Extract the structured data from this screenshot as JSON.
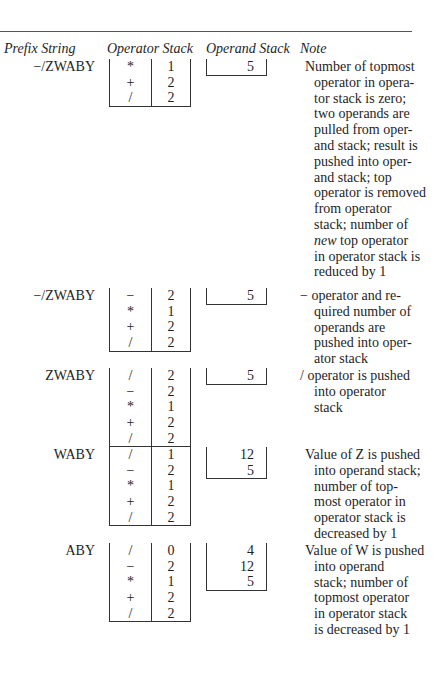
{
  "headers": {
    "prefix": "Prefix String",
    "operator_stack": "Operator Stack",
    "operand_stack": "Operand Stack",
    "note": "Note"
  },
  "steps": [
    {
      "prefix": "−/ZWABY",
      "operators": [
        [
          "*",
          "1"
        ],
        [
          "+",
          "2"
        ],
        [
          "/",
          "2"
        ]
      ],
      "operands": [
        "5"
      ],
      "note_lines": [
        "Number of topmost",
        "operator in opera-",
        "tor stack is zero;",
        "two operands are",
        "pulled from oper-",
        "and stack; result is",
        "pushed into oper-",
        "and stack; top",
        "operator is removed",
        "from operator",
        "stack; number of",
        "new top operator",
        "in operator stack is",
        "reduced by 1"
      ]
    },
    {
      "prefix": "−/ZWABY",
      "operators": [
        [
          "−",
          "2"
        ],
        [
          "*",
          "1"
        ],
        [
          "+",
          "2"
        ],
        [
          "/",
          "2"
        ]
      ],
      "operands": [
        "5"
      ],
      "note_lines": [
        "− operator and re-",
        "quired number of",
        "operands are",
        "pushed into oper-",
        "ator stack"
      ]
    },
    {
      "prefix": "ZWABY",
      "operators": [
        [
          "/",
          "2"
        ],
        [
          "−",
          "2"
        ],
        [
          "*",
          "1"
        ],
        [
          "+",
          "2"
        ],
        [
          "/",
          "2"
        ]
      ],
      "operands": [
        "5"
      ],
      "note_lines": [
        "/ operator is pushed",
        "into operator",
        "stack"
      ]
    },
    {
      "prefix": "WABY",
      "operators": [
        [
          "/",
          "1"
        ],
        [
          "−",
          "2"
        ],
        [
          "*",
          "1"
        ],
        [
          "+",
          "2"
        ],
        [
          "/",
          "2"
        ]
      ],
      "operands": [
        "12",
        "5"
      ],
      "note_lines": [
        "Value of Z is pushed",
        "into operand stack;",
        "number of top-",
        "most operator in",
        "operator stack is",
        "decreased by 1"
      ]
    },
    {
      "prefix": "ABY",
      "operators": [
        [
          "/",
          "0"
        ],
        [
          "−",
          "2"
        ],
        [
          "*",
          "1"
        ],
        [
          "+",
          "2"
        ],
        [
          "/",
          "2"
        ]
      ],
      "operands": [
        "4",
        "12",
        "5"
      ],
      "note_lines": [
        "Value of W is pushed",
        "into operand",
        "stack; number of",
        "topmost operator",
        "in operator stack",
        "is decreased by 1"
      ]
    }
  ]
}
